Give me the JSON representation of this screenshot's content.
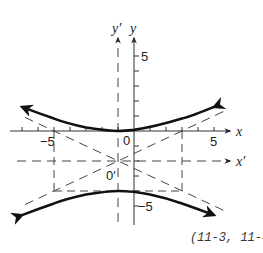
{
  "figure": {
    "caption": "(11-3, 11-4)",
    "labels": {
      "x_axis": "x",
      "y_axis": "y",
      "x_prime_axis": "x′",
      "y_prime_axis": "y′",
      "origin": "0",
      "origin_prime": "0′",
      "x_pos5": "5",
      "x_neg5": "−5",
      "y_pos5": "5",
      "y_neg5": "−5"
    },
    "colors": {
      "curve": "#111111",
      "axis": "#333333",
      "dashed": "#444444",
      "background": "#ffffff"
    },
    "hyperbola": {
      "equation": "(y+2)^2/4 - (x+1)^2/16 = 1",
      "center": [
        -1,
        -2
      ],
      "vertices": [
        [
          -1,
          0
        ],
        [
          -1,
          -4
        ]
      ],
      "asymptote_slopes": [
        0.5,
        -0.5
      ],
      "box": {
        "x_range": [
          -5,
          3
        ],
        "y_range": [
          -4,
          0
        ]
      }
    },
    "axes": {
      "x_range": [
        -7,
        6
      ],
      "y_range": [
        -6,
        6
      ],
      "tick_step": 1
    }
  }
}
